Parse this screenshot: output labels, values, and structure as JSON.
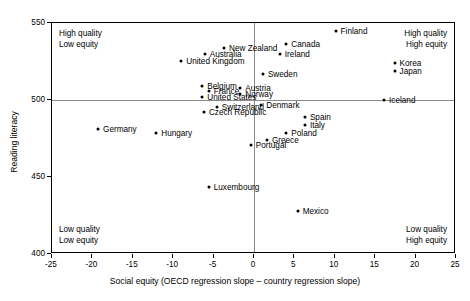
{
  "chart_data": {
    "type": "scatter",
    "title": "",
    "xlabel": "Social equity (OECD regression slope – country regression slope)",
    "ylabel": "Reading literacy",
    "xlim": [
      -25,
      25
    ],
    "ylim": [
      400,
      550
    ],
    "xticks": [
      -25,
      -20,
      -15,
      -10,
      -5,
      0,
      5,
      10,
      15,
      20,
      25
    ],
    "yticks": [
      400,
      450,
      500,
      550
    ],
    "grid": false,
    "reference_lines": {
      "vertical_x": 0,
      "horizontal_y": 500
    },
    "legend": "none",
    "annotations": [
      {
        "name": "top-left",
        "text": "High quality\nLow equity",
        "line1": "High quality",
        "line2": "Low equity"
      },
      {
        "name": "top-right",
        "text": "High quality\nHigh equity",
        "line1": "High quality",
        "line2": "High equity"
      },
      {
        "name": "bottom-left",
        "text": "Low quality\nLow equity",
        "line1": "Low quality",
        "line2": "Low equity"
      },
      {
        "name": "bottom-right",
        "text": "Low quality\nHigh equity",
        "line1": "Low quality",
        "line2": "High equity"
      }
    ],
    "points": [
      {
        "label": "Finland",
        "x": 10.1,
        "y": 544.8,
        "side": "right"
      },
      {
        "label": "Canada",
        "x": 4.0,
        "y": 536.4,
        "side": "right"
      },
      {
        "label": "New Zealand",
        "x": -3.7,
        "y": 533.8,
        "side": "right"
      },
      {
        "label": "Australia",
        "x": -6.1,
        "y": 529.9,
        "side": "right"
      },
      {
        "label": "Ireland",
        "x": 3.2,
        "y": 529.9,
        "side": "right"
      },
      {
        "label": "Korea",
        "x": 17.4,
        "y": 524.0,
        "side": "right"
      },
      {
        "label": "United Kingdom",
        "x": -9.0,
        "y": 525.3,
        "side": "right"
      },
      {
        "label": "Japan",
        "x": 17.4,
        "y": 518.8,
        "side": "right"
      },
      {
        "label": "Sweden",
        "x": 1.1,
        "y": 516.9,
        "side": "right"
      },
      {
        "label": "Belgium",
        "x": -6.4,
        "y": 509.1,
        "side": "right"
      },
      {
        "label": "Austria",
        "x": -1.7,
        "y": 507.8,
        "side": "right"
      },
      {
        "label": "France",
        "x": -5.6,
        "y": 505.8,
        "side": "right"
      },
      {
        "label": "Norway",
        "x": -1.7,
        "y": 503.9,
        "side": "right"
      },
      {
        "label": "Iceland",
        "x": 16.1,
        "y": 500.0,
        "side": "right"
      },
      {
        "label": "United States",
        "x": -6.4,
        "y": 501.9,
        "side": "right"
      },
      {
        "label": "Denmark",
        "x": 0.9,
        "y": 496.8,
        "side": "right"
      },
      {
        "label": "Switzerland",
        "x": -4.6,
        "y": 495.5,
        "side": "right"
      },
      {
        "label": "Czech Republic",
        "x": -6.2,
        "y": 492.2,
        "side": "right"
      },
      {
        "label": "Spain",
        "x": 6.3,
        "y": 489.0,
        "side": "right"
      },
      {
        "label": "Italy",
        "x": 6.3,
        "y": 483.8,
        "side": "right"
      },
      {
        "label": "Germany",
        "x": -19.3,
        "y": 481.2,
        "side": "right"
      },
      {
        "label": "Poland",
        "x": 4.0,
        "y": 478.6,
        "side": "right"
      },
      {
        "label": "Hungary",
        "x": -12.1,
        "y": 478.6,
        "side": "right"
      },
      {
        "label": "Greece",
        "x": 1.6,
        "y": 474.0,
        "side": "right"
      },
      {
        "label": "Portugal",
        "x": -0.4,
        "y": 470.8,
        "side": "right"
      },
      {
        "label": "Luxembourg",
        "x": -5.6,
        "y": 443.7,
        "side": "right"
      },
      {
        "label": "Mexico",
        "x": 5.4,
        "y": 428.1,
        "side": "right"
      }
    ]
  }
}
